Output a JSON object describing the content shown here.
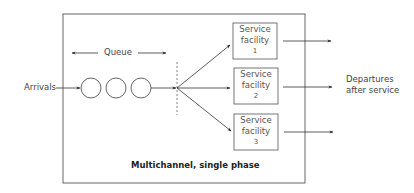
{
  "diagram": {
    "title": "Multichannel, single phase",
    "queue_label": "Queue",
    "arrivals_label": "Arrivals",
    "departures_label_line1": "Departures",
    "departures_label_line2": "after service",
    "queue_customers": 3,
    "service_facilities": [
      {
        "line1": "Service",
        "line2": "facility",
        "number": "1"
      },
      {
        "line1": "Service",
        "line2": "facility",
        "number": "2"
      },
      {
        "line1": "Service",
        "line2": "facility",
        "number": "3"
      }
    ],
    "colors": {
      "line": "#444444",
      "box_border": "#666666",
      "background": "#ffffff"
    }
  }
}
